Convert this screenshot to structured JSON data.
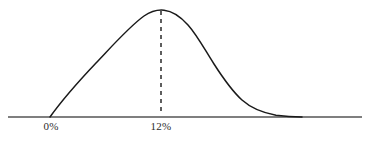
{
  "figure": {
    "background_color": "#ffffff",
    "width": 370,
    "height": 141,
    "axis_color": "#555555",
    "curve_color": "#1a1a1a",
    "dashed_line_color": "#1a1a1a",
    "label_color": "#2b2b2b"
  },
  "labels": {
    "zero": "0%",
    "twelve": "12%"
  },
  "chart_data": {
    "type": "line",
    "title": "",
    "subtitle": "",
    "xlabel": "",
    "ylabel": "",
    "grid": false,
    "legend": null,
    "axis": {
      "x_axis_visible": true,
      "y_axis_visible": false,
      "x_axis_y_pixel": 117,
      "x_axis_start_pixel": 8,
      "x_axis_end_pixel": 362
    },
    "tick_labels": [
      "0%",
      "12%"
    ],
    "tick_x_pixels": [
      51,
      161
    ],
    "annotations": [
      {
        "type": "vertical-dashed-line",
        "label": "12%",
        "x_pixel": 161,
        "y_top_pixel": 11,
        "y_bottom_pixel": 115,
        "dash_pattern": "4 4"
      }
    ],
    "series": [
      {
        "name": "distribution",
        "description": "right-skewed unimodal density curve peaking at 12%",
        "peak_x_pixel": 161,
        "peak_y_pixel": 10,
        "left_foot_x_pixel": 50,
        "right_tail_x_pixel": 302,
        "x": [
          50,
          60,
          70,
          80,
          90,
          100,
          110,
          120,
          130,
          140,
          150,
          161,
          170,
          180,
          190,
          200,
          210,
          220,
          230,
          240,
          250,
          260,
          270,
          280,
          290,
          302
        ],
        "y": [
          117,
          106,
          95,
          84,
          73,
          62,
          52,
          42,
          32,
          24,
          16,
          10,
          10,
          13,
          19,
          28,
          40,
          53,
          66,
          78,
          88,
          97,
          104,
          110,
          114,
          117
        ]
      }
    ],
    "xlim_pixels": [
      8,
      362
    ],
    "ylim_pixels": [
      117,
      10
    ]
  }
}
